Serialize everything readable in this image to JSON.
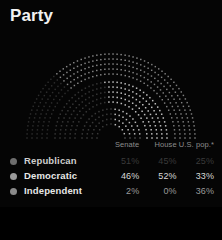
{
  "header": {
    "title": "Party"
  },
  "legend": {
    "columns": [
      "",
      "Senate",
      "House",
      "U.S. pop.*"
    ],
    "rows": [
      {
        "party": "Republican",
        "dot_color": "#6e6e6e",
        "senate": "51%",
        "house": "45%",
        "us_pop": "25%",
        "state": "dim"
      },
      {
        "party": "Democratic",
        "dot_color": "#9a9a9a",
        "senate": "46%",
        "house": "52%",
        "us_pop": "33%",
        "state": "bright"
      },
      {
        "party": "Independent",
        "dot_color": "#8a8a8a",
        "senate": "2%",
        "house": "0%",
        "us_pop": "36%",
        "state": "mid"
      }
    ]
  },
  "chart_data": {
    "type": "bar",
    "title": "Party",
    "xlabel": "",
    "ylabel": "",
    "categories": [
      "Senate",
      "House",
      "U.S. pop.*"
    ],
    "series": [
      {
        "name": "Republican",
        "values": [
          51,
          45,
          25
        ]
      },
      {
        "name": "Democratic",
        "values": [
          46,
          52,
          33
        ]
      },
      {
        "name": "Independent",
        "values": [
          2,
          0,
          36
        ]
      }
    ],
    "ylim": [
      0,
      100
    ],
    "grid": false,
    "legend_position": "bottom",
    "arcs": [
      {
        "name": "U.S. pop.*",
        "ring": "outer",
        "segments": [
          25,
          33,
          36
        ]
      },
      {
        "name": "House",
        "ring": "middle",
        "segments": [
          45,
          52,
          0
        ]
      },
      {
        "name": "Senate",
        "ring": "inner",
        "segments": [
          51,
          46,
          2
        ]
      }
    ],
    "colors": {
      "republican": "#6e6e6e",
      "democratic": "#d8d8d8",
      "independent": "#8a8a8a",
      "background": "#050505"
    }
  }
}
